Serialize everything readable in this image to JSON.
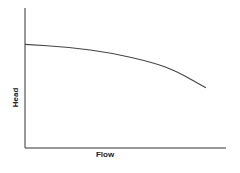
{
  "chart_data": {
    "type": "line",
    "title": "",
    "xlabel": "Flow",
    "ylabel": "Head",
    "grid": false,
    "legend": null,
    "ticks": {
      "x": [],
      "y": []
    },
    "xlim": [
      0,
      1
    ],
    "ylim": [
      0,
      1
    ],
    "series": [
      {
        "name": "Pump curve",
        "x": [
          0.0,
          0.22,
          0.43,
          0.64,
          0.75,
          0.85,
          0.9
        ],
        "y": [
          0.74,
          0.72,
          0.68,
          0.61,
          0.55,
          0.47,
          0.43
        ]
      }
    ],
    "colors": {
      "axis": "#333333",
      "line": "#444444",
      "text": "#222222"
    }
  }
}
